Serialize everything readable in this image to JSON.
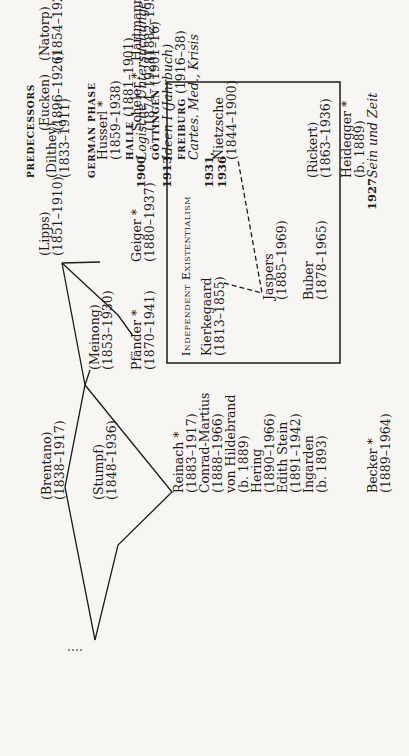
{
  "header": {
    "predecessors_label": "PREDECESSORS",
    "german_phase_label": "GERMAN PHASE"
  },
  "predecessors": [
    {
      "name": "(Dilthey)",
      "dates": "(1833–1911)"
    },
    {
      "name": "(Brentano)",
      "dates": "(1838–1917)"
    },
    {
      "name": "(Stumpf)",
      "dates": "(1848–1936)"
    },
    {
      "name": "(Meinong)",
      "dates": "(1853–1930)"
    },
    {
      "name": "(Lipps)",
      "dates": "(1851–1910)"
    },
    {
      "name": "(Eucken)",
      "dates": "(1896–1926)"
    },
    {
      "name": "(Natorp)",
      "dates": "(1854–1924)"
    },
    {
      "name": "(Rickert)",
      "dates": "(1863–1936)"
    }
  ],
  "husserl": {
    "name": "Husserl *",
    "dates": "(1859–1938)",
    "halle_label": "HALLE",
    "halle_dates": "(1881–1901)",
    "year_1900": "1900",
    "logische": "Logische Untersuchungen",
    "gottingen_label": "GÖTTINGEN",
    "gottingen_dates": "(1901–16)",
    "year_1913": "1913",
    "ideen": "Ideen I (Jahrbuch)",
    "freiburg_label": "FREIBURG",
    "freiburg_dates": "(1916–38)",
    "cartes": "Cartes. Med., Krisis",
    "year_1931": "1931,",
    "year_1936": "1936"
  },
  "munich_gottingen": [
    {
      "name": "Reinach *",
      "dates": "(1883–1917)"
    },
    {
      "name": "Conrad-Martius",
      "dates": "(1888–1966)"
    },
    {
      "name": "von Hildebrand",
      "dates": "(b. 1889)"
    },
    {
      "name": "Hering",
      "dates": "(1890–1966)"
    },
    {
      "name": "Edith Stein",
      "dates": "(1891–1942)"
    },
    {
      "name": "Ingarden",
      "dates": "(b. 1893)"
    }
  ],
  "munich": [
    {
      "name": "Pfänder *",
      "dates": "(1870–1941)"
    },
    {
      "name": "Geiger *",
      "dates": "(1880–1937)"
    },
    {
      "name": "Scheler *",
      "dates": "(1874–1928)"
    },
    {
      "name": "Hartmann *",
      "dates": "(1882–1950)"
    }
  ],
  "freiburg": {
    "heidegger_name": "Heidegger *",
    "heidegger_dates": "(b. 1889)",
    "year_1927": "1927",
    "sein": "Sein und Zeit",
    "becker_name": "Becker *",
    "becker_dates": "(1889–1964)"
  },
  "existentialism_box": {
    "title_a": "Independent",
    "title_b": "Existentialism",
    "members": [
      {
        "name": "Kierkegaard",
        "dates": "(1813–1855)"
      },
      {
        "name": "Jaspers",
        "dates": "(1885–1969)"
      },
      {
        "name": "Buber",
        "dates": "(1878–1965)"
      },
      {
        "name": "Nietzsche",
        "dates": "(1844–1900)"
      }
    ]
  }
}
